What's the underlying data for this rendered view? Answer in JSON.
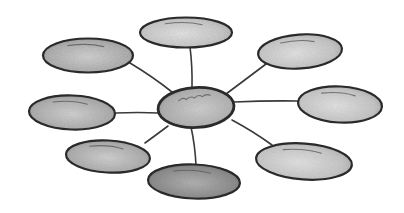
{
  "diagram": {
    "type": "hub-and-spoke bubble diagram (hand-drawn)",
    "colors": {
      "background": "#ffffff",
      "outline": "#2a2a2a",
      "fill_light": "#d6d6d6",
      "fill_mid": "#b8b8b8",
      "fill_dark": "#8f8f8f",
      "connector": "#3a3a3a"
    },
    "hub": {
      "name": "center-node",
      "cx": 196,
      "cy": 107,
      "rx": 38,
      "ry": 20,
      "rotate": -3
    },
    "nodes": [
      {
        "name": "node-top",
        "cx": 186,
        "cy": 32,
        "rx": 46,
        "ry": 15,
        "rotate": 0,
        "shade": "light"
      },
      {
        "name": "node-top-right",
        "cx": 300,
        "cy": 51,
        "rx": 42,
        "ry": 17,
        "rotate": -4,
        "shade": "light"
      },
      {
        "name": "node-right",
        "cx": 340,
        "cy": 104,
        "rx": 42,
        "ry": 18,
        "rotate": 3,
        "shade": "light"
      },
      {
        "name": "node-bottom-right",
        "cx": 304,
        "cy": 161,
        "rx": 48,
        "ry": 18,
        "rotate": 4,
        "shade": "light"
      },
      {
        "name": "node-bottom",
        "cx": 194,
        "cy": 181,
        "rx": 46,
        "ry": 17,
        "rotate": 2,
        "shade": "dark"
      },
      {
        "name": "node-bottom-left",
        "cx": 108,
        "cy": 156,
        "rx": 42,
        "ry": 16,
        "rotate": 3,
        "shade": "mid"
      },
      {
        "name": "node-left",
        "cx": 72,
        "cy": 112,
        "rx": 43,
        "ry": 17,
        "rotate": 2,
        "shade": "mid"
      },
      {
        "name": "node-top-left",
        "cx": 88,
        "cy": 55,
        "rx": 45,
        "ry": 17,
        "rotate": 0,
        "shade": "mid"
      }
    ],
    "connectors": [
      {
        "name": "connector-top",
        "x1": 192,
        "y1": 88,
        "x2": 190,
        "y2": 47
      },
      {
        "name": "connector-top-right",
        "x1": 226,
        "y1": 94,
        "x2": 266,
        "y2": 64
      },
      {
        "name": "connector-right",
        "x1": 234,
        "y1": 102,
        "x2": 298,
        "y2": 101
      },
      {
        "name": "connector-bottom-right",
        "x1": 232,
        "y1": 120,
        "x2": 272,
        "y2": 145
      },
      {
        "name": "connector-bottom",
        "x1": 191,
        "y1": 127,
        "x2": 196,
        "y2": 165
      },
      {
        "name": "connector-bottom-left",
        "x1": 168,
        "y1": 126,
        "x2": 145,
        "y2": 143
      },
      {
        "name": "connector-left",
        "x1": 159,
        "y1": 113,
        "x2": 115,
        "y2": 113
      },
      {
        "name": "connector-top-left",
        "x1": 172,
        "y1": 92,
        "x2": 130,
        "y2": 63
      }
    ]
  }
}
